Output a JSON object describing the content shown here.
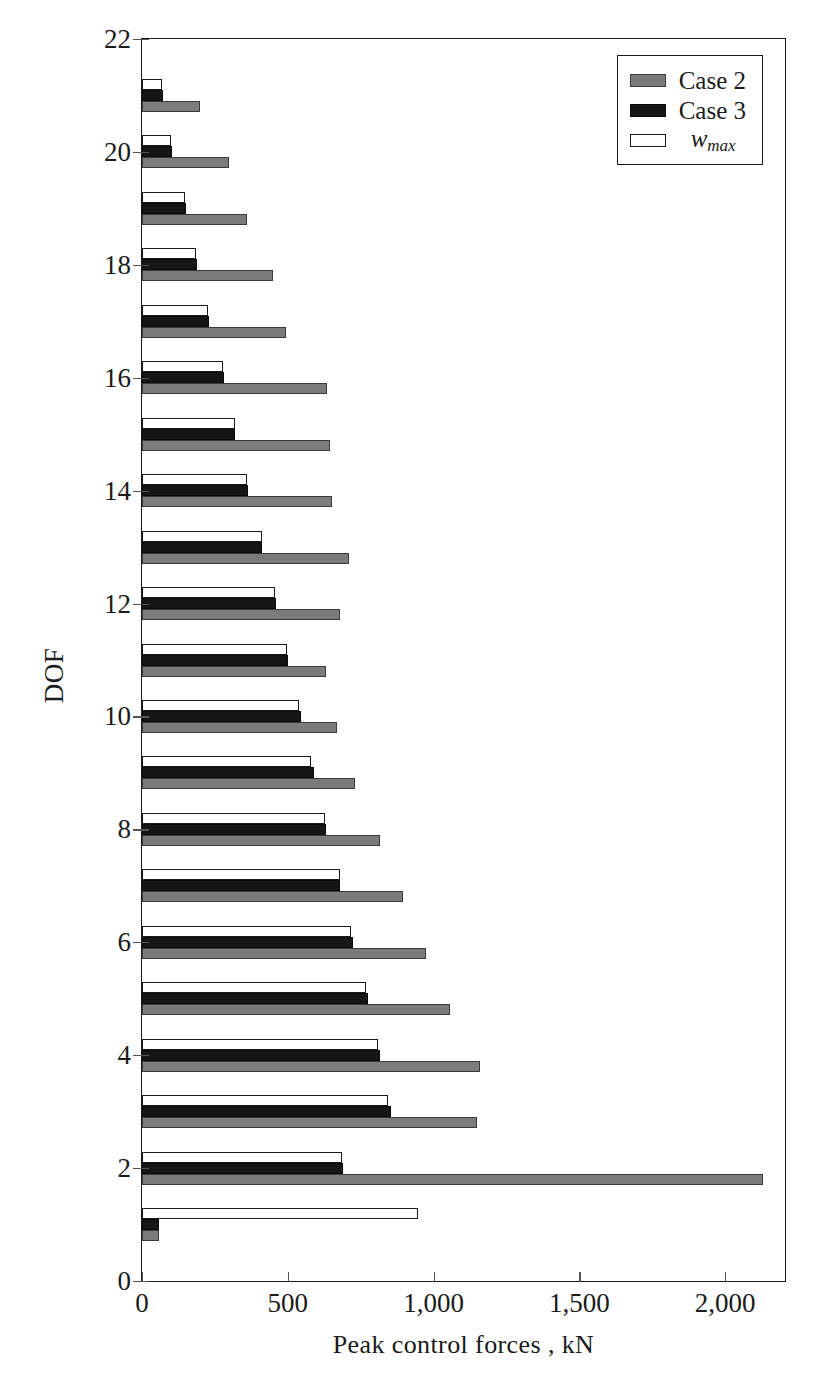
{
  "chart_data": {
    "type": "bar",
    "orientation": "horizontal",
    "title": "",
    "xlabel": "Peak control forces , kN",
    "ylabel": "DOF",
    "xlim": [
      0,
      2205
    ],
    "ylim": [
      0,
      22
    ],
    "xticks": [
      0,
      500,
      1000,
      1500,
      2000
    ],
    "xticklabels": [
      "0",
      "500",
      "1,000",
      "1,500",
      "2,000"
    ],
    "yticks": [
      0,
      2,
      4,
      6,
      8,
      10,
      12,
      14,
      16,
      18,
      20,
      22
    ],
    "yticklabels": [
      "0",
      "2",
      "4",
      "6",
      "8",
      "10",
      "12",
      "14",
      "16",
      "18",
      "20",
      "22"
    ],
    "grid": false,
    "legend_position": "upper right",
    "categories": [
      1,
      2,
      3,
      4,
      5,
      6,
      7,
      8,
      9,
      10,
      11,
      12,
      13,
      14,
      15,
      16,
      17,
      18,
      19,
      20,
      21
    ],
    "series": [
      {
        "name": "Case 2",
        "color": "#7b7b7b",
        "values": [
          60,
          2130,
          1150,
          1160,
          1055,
          975,
          895,
          815,
          730,
          670,
          630,
          680,
          710,
          650,
          645,
          635,
          495,
          450,
          360,
          300,
          200
        ]
      },
      {
        "name": "Case 3",
        "color": "#161616",
        "values": [
          60,
          690,
          855,
          815,
          775,
          725,
          680,
          630,
          590,
          545,
          500,
          460,
          410,
          365,
          320,
          280,
          230,
          188,
          152,
          103,
          72
        ]
      },
      {
        "name": "w_max",
        "color": "#ffffff",
        "values": [
          945,
          685,
          845,
          808,
          768,
          715,
          678,
          628,
          580,
          540,
          497,
          455,
          412,
          360,
          318,
          277,
          228,
          185,
          148,
          98,
          67
        ]
      }
    ]
  },
  "legend": {
    "items": [
      {
        "label": "Case 2",
        "style": "case2"
      },
      {
        "label": "Case 3",
        "style": "case3"
      },
      {
        "label": "w",
        "sublabel": "max",
        "style": "wmax"
      }
    ]
  },
  "axes": {
    "x_title": "Peak control forces , kN",
    "y_title": "DOF"
  }
}
